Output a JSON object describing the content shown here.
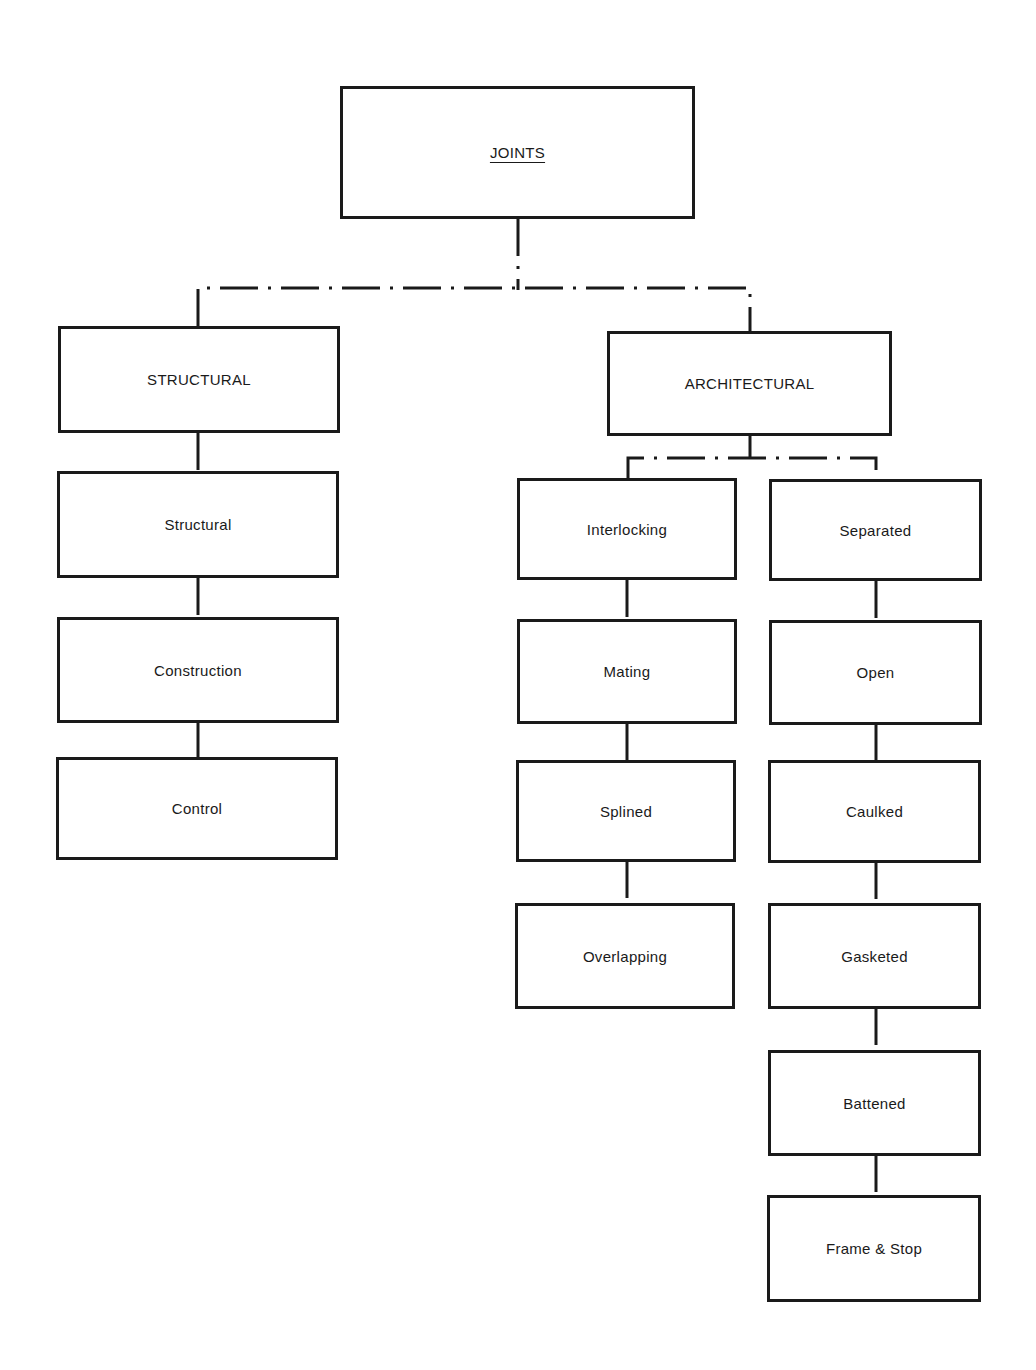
{
  "diagram": {
    "root": {
      "label": "JOINTS"
    },
    "branches": {
      "structural": {
        "label": "STRUCTURAL",
        "children": [
          "Structural",
          "Construction",
          "Control"
        ]
      },
      "architectural": {
        "label": "ARCHITECTURAL",
        "groups": {
          "interlocking": {
            "label": "Interlocking",
            "children": [
              "Mating",
              "Splined",
              "Overlapping"
            ]
          },
          "separated": {
            "label": "Separated",
            "children": [
              "Open",
              "Caulked",
              "Gasketed",
              "Battened",
              "Frame & Stop"
            ]
          }
        }
      }
    },
    "connector_style": "dash-dot"
  }
}
